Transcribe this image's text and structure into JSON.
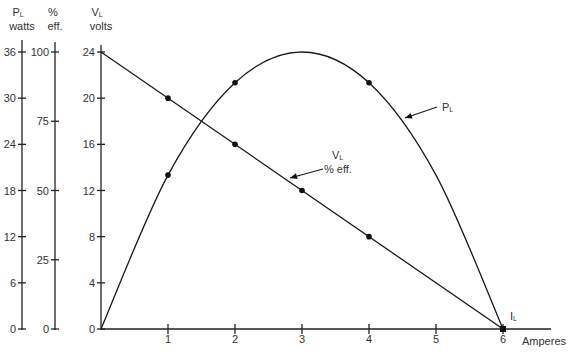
{
  "chart_data": {
    "type": "line",
    "title": "",
    "xlabel": "Amperes",
    "x_symbol": "I",
    "x_symbol_sub": "L",
    "x": [
      0,
      1,
      2,
      3,
      4,
      5,
      6
    ],
    "x_ticks": [
      "1",
      "2",
      "3",
      "4",
      "5",
      "6"
    ],
    "xlim": [
      0,
      6.7
    ],
    "grid": false,
    "y_axes": [
      {
        "id": "power",
        "symbol": "P",
        "symbol_sub": "L",
        "unit": "watts",
        "ticks": [
          0,
          6,
          12,
          18,
          24,
          30,
          36
        ],
        "ylim": [
          0,
          36
        ]
      },
      {
        "id": "efficiency",
        "symbol": "%",
        "symbol_sub": "",
        "unit": "eff.",
        "ticks": [
          0,
          25,
          50,
          75,
          100
        ],
        "ylim": [
          0,
          100
        ]
      },
      {
        "id": "voltage",
        "symbol": "V",
        "symbol_sub": "L",
        "unit": "volts",
        "ticks": [
          0,
          4,
          8,
          12,
          16,
          20,
          24
        ],
        "ylim": [
          0,
          24
        ]
      }
    ],
    "series": [
      {
        "name": "V_L / % eff.",
        "label_main": "V",
        "label_sub": "L",
        "label_line2": "% eff.",
        "axis": "voltage",
        "x": [
          0,
          1,
          2,
          3,
          4,
          5,
          6
        ],
        "values": [
          24,
          20,
          16,
          12,
          8,
          4,
          0
        ],
        "efficiency_percent": [
          100,
          83.3,
          66.7,
          50,
          33.3,
          16.7,
          0
        ],
        "markers_at": [
          1,
          2,
          3,
          4,
          6
        ]
      },
      {
        "name": "P_L",
        "label_main": "P",
        "label_sub": "L",
        "axis": "power",
        "x": [
          0,
          1,
          2,
          3,
          4,
          5,
          6
        ],
        "values": [
          0,
          20,
          32,
          36,
          32,
          20,
          0
        ],
        "markers_at": [
          1,
          2,
          4
        ]
      }
    ],
    "annotations": [
      {
        "text": "P_L",
        "points_to_series": "P_L",
        "at_x": 4.5
      },
      {
        "text": "V_L % eff.",
        "points_to_series": "V_L / % eff.",
        "at_x": 2.8
      },
      {
        "text": "I_L",
        "at_x": 6
      }
    ]
  }
}
